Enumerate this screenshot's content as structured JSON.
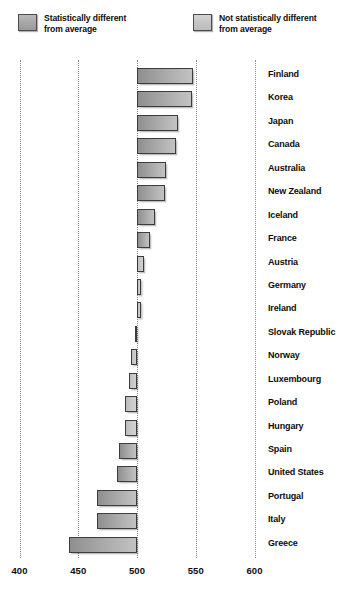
{
  "legend": {
    "items": [
      {
        "key": "sig",
        "label": "Statistically different\nfrom average",
        "swatch_color": "#a8a8a8"
      },
      {
        "key": "nosig",
        "label": "Not statistically different\nfrom average",
        "swatch_color": "#c6c6c6"
      }
    ]
  },
  "chart_data": {
    "type": "bar",
    "orientation": "horizontal",
    "title": "",
    "subtitle": "",
    "xlabel": "",
    "ylabel": "",
    "xlim": [
      400,
      600
    ],
    "baseline": 500,
    "xticks": [
      400,
      450,
      500,
      550,
      600
    ],
    "grid": "vertical-dotted",
    "legend_position": "top",
    "categories": [
      "Finland",
      "Korea",
      "Japan",
      "Canada",
      "Australia",
      "New Zealand",
      "Iceland",
      "France",
      "Austria",
      "Germany",
      "Ireland",
      "Slovak Republic",
      "Norway",
      "Luxembourg",
      "Poland",
      "Hungary",
      "Spain",
      "United States",
      "Portugal",
      "Italy",
      "Greece"
    ],
    "values": [
      548,
      547,
      535,
      533,
      525,
      524,
      515,
      511,
      506,
      503,
      503,
      498,
      495,
      493,
      490,
      490,
      485,
      483,
      466,
      466,
      442
    ],
    "significance": [
      "sig",
      "sig",
      "sig",
      "sig",
      "sig",
      "sig",
      "sig",
      "sig",
      "nosig",
      "nosig",
      "nosig",
      "nosig",
      "nosig",
      "nosig",
      "nosig",
      "nosig",
      "sig",
      "sig",
      "sig",
      "sig",
      "sig"
    ]
  }
}
